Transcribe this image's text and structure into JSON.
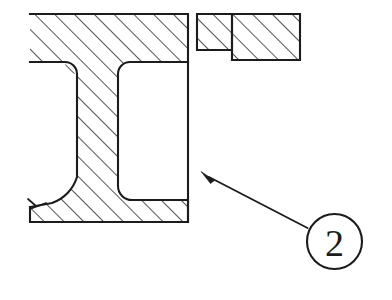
{
  "drawing": {
    "title": "Sectional view of beam profile with callout",
    "background_color": "#ffffff",
    "line_color": "#1c1c1c",
    "canvas": {
      "width": 392,
      "height": 300
    }
  },
  "callout": {
    "balloon_number": "2",
    "balloon": {
      "cx": 334.5,
      "cy": 241.5,
      "r": 27.5
    },
    "leader": {
      "x1": 307.5,
      "y1": 228.0,
      "x2": 204.0,
      "y2": 174.0
    },
    "arrow_tip": {
      "x": 201.0,
      "y": 171.5
    }
  },
  "hatching": {
    "angle_degrees": 45,
    "spacing_px": 14,
    "direction": "lower-left-to-upper-right"
  },
  "regions": [
    {
      "name": "main-channel-section",
      "description": "I-beam / channel cross-section with top flange, web, bottom flange and rounded inner cavity"
    },
    {
      "name": "upper-right-small-block",
      "description": "narrow hatched block adjacent to the gap"
    },
    {
      "name": "upper-right-large-block",
      "description": "taller hatched rectangular block at far upper right"
    }
  ],
  "annotations": {
    "break_line": "short zigzag break mark at lower left of bottom flange"
  }
}
